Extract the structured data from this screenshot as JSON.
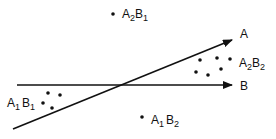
{
  "diagram": {
    "axes": [
      {
        "name": "A",
        "label": "A",
        "from": [
          13,
          129
        ],
        "to": [
          232,
          40
        ]
      },
      {
        "name": "B",
        "label": "B",
        "from": [
          17,
          85
        ],
        "to": [
          232,
          85
        ]
      }
    ],
    "clusters": [
      {
        "id": "A2B1",
        "base1": "A",
        "sub1": "2",
        "base2": "B",
        "sub2": "1",
        "dots": [
          [
            113,
            14
          ]
        ],
        "label_pos": [
          122,
          18
        ]
      },
      {
        "id": "A2B2",
        "base1": "A",
        "sub1": "2",
        "base2": "B",
        "sub2": "2",
        "dots": [
          [
            200,
            60
          ],
          [
            217,
            58
          ],
          [
            230,
            59
          ],
          [
            196,
            72
          ],
          [
            208,
            75
          ],
          [
            221,
            69
          ]
        ],
        "label_pos": [
          239,
          67
        ]
      },
      {
        "id": "A1B1",
        "base1": "A",
        "sub1": "1",
        "base2": "B",
        "sub2": "1",
        "dots": [
          [
            48,
            93
          ],
          [
            60,
            95
          ],
          [
            43,
            103
          ],
          [
            52,
            108
          ]
        ],
        "label_pos": [
          7,
          107
        ]
      },
      {
        "id": "A1B2",
        "base1": "A",
        "sub1": "1",
        "base2": "B",
        "sub2": "2",
        "dots": [
          [
            142,
            117
          ]
        ],
        "label_pos": [
          151,
          124
        ]
      }
    ],
    "colors": {
      "ink": "#111111",
      "background": "#ffffff"
    }
  }
}
